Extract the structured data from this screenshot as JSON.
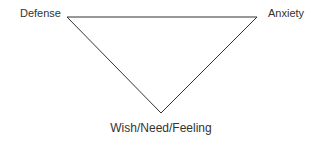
{
  "diagram": {
    "type": "triangle",
    "line_color": "#333333",
    "vertices": {
      "top_left": "Defense",
      "top_right": "Anxiety",
      "bottom": "Wish/Need/Feeling"
    },
    "labels": {
      "defense": "Defense",
      "anxiety": "Anxiety",
      "wish": "Wish/Need/Feeling"
    }
  }
}
